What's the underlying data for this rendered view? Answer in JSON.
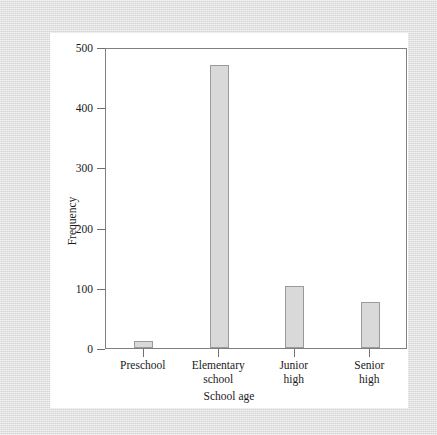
{
  "figure": {
    "background_color": "#dcdcdc",
    "card_color": "#ffffff",
    "frame_color": "#808080",
    "bar_fill": "#d9d9d9",
    "bar_edge": "#9a9a9a"
  },
  "chart_data": {
    "type": "bar",
    "title": "",
    "xlabel": "School age",
    "ylabel": "Frequency",
    "categories": [
      "Preschool",
      "Elementary school",
      "Junior high",
      "Senior high"
    ],
    "category_lines": [
      [
        "Preschool"
      ],
      [
        "Elementary",
        "school"
      ],
      [
        "Junior",
        "high"
      ],
      [
        "Senior",
        "high"
      ]
    ],
    "values": [
      12,
      470,
      103,
      76
    ],
    "ylim": [
      0,
      500
    ],
    "yticks": [
      0,
      100,
      200,
      300,
      400,
      500
    ],
    "ytick_labels": [
      "0",
      "100",
      "200",
      "300",
      "400",
      "500"
    ],
    "grid": false,
    "legend": null
  }
}
